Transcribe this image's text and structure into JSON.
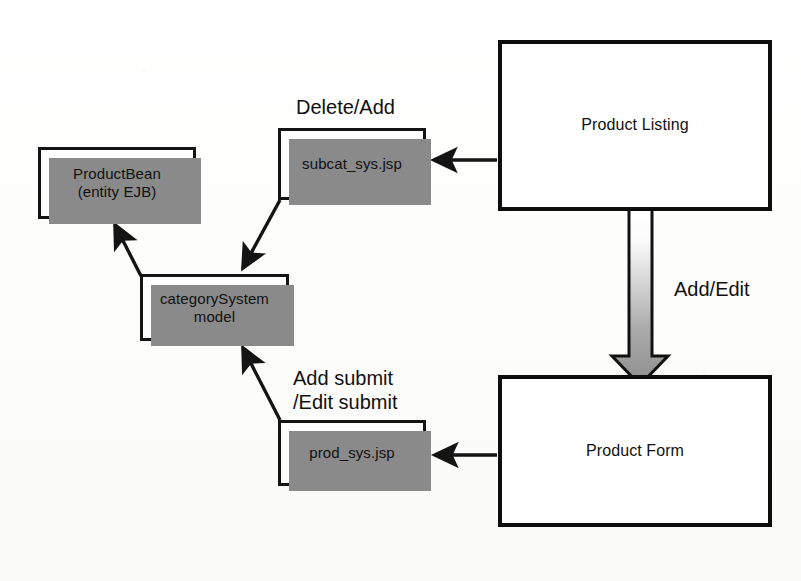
{
  "diagram": {
    "background_color": "#fbfbfa",
    "stroke_color": "#141414",
    "shadow_color": "#8a8a8a",
    "nodes": [
      {
        "id": "product_bean",
        "label_line1": "ProductBean",
        "label_line2": "(entity EJB)",
        "style": "small"
      },
      {
        "id": "subcat_jsp",
        "label_line1": "subcat_sys.jsp",
        "label_line2": "",
        "style": "small"
      },
      {
        "id": "category_model",
        "label_line1": "categorySystem",
        "label_line2": "model",
        "style": "small"
      },
      {
        "id": "prod_jsp",
        "label_line1": "prod_sys.jsp",
        "label_line2": "",
        "style": "small"
      },
      {
        "id": "product_listing",
        "label_line1": "Product Listing",
        "label_line2": "",
        "style": "big"
      },
      {
        "id": "product_form",
        "label_line1": "Product Form",
        "label_line2": "",
        "style": "big"
      }
    ],
    "edge_labels": {
      "delete_add": "Delete/Add",
      "add_edit": "Add/Edit",
      "add_submit_line1": "Add submit",
      "add_submit_line2": "/Edit submit"
    },
    "big_arrow": {
      "name": "add-edit-block-arrow",
      "direction": "down",
      "fill_top": "#ffffff",
      "fill_bottom": "#8e8e8e"
    }
  }
}
